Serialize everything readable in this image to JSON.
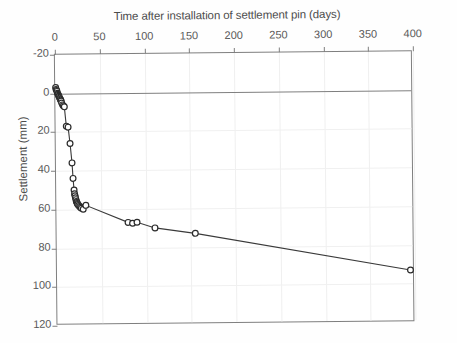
{
  "chart_data": {
    "type": "line",
    "title": "Time after installation of settlement pin (days)",
    "xlabel": "Time after installation of settlement pin (days)",
    "ylabel": "Settlement (mm)",
    "xlim": [
      0,
      400
    ],
    "ylim": [
      -20,
      120
    ],
    "y_inverted": true,
    "grid": true,
    "legend": "none",
    "xticks": [
      0,
      50,
      100,
      150,
      200,
      250,
      300,
      350,
      400
    ],
    "yticks": [
      -20,
      0,
      20,
      40,
      60,
      80,
      100,
      120
    ],
    "series": [
      {
        "name": "Settlement pin",
        "marker": "open-circle",
        "x": [
          0.5,
          1,
          1.5,
          2,
          2.5,
          3,
          3.5,
          4,
          4.5,
          5,
          5.5,
          6,
          6.5,
          7,
          8,
          9,
          10,
          12,
          14,
          16,
          18,
          19,
          20,
          20.5,
          21,
          21.5,
          22,
          22.5,
          23,
          23.5,
          24,
          25,
          26,
          27,
          28,
          30,
          33,
          80,
          85,
          90,
          110,
          155,
          395
        ],
        "y": [
          -3,
          -2,
          -1.5,
          -1,
          0,
          0.5,
          1,
          1.5,
          2,
          2.5,
          3,
          3.5,
          4,
          5,
          6,
          6.5,
          7,
          17,
          17.5,
          26,
          36,
          44,
          50,
          52,
          53,
          54,
          55,
          56,
          56.5,
          57,
          57.5,
          58,
          58.5,
          59,
          59.5,
          60,
          58,
          67,
          67.5,
          67,
          70,
          73,
          93
        ]
      }
    ]
  },
  "axes": {
    "x_tick_labels": [
      "0",
      "50",
      "100",
      "150",
      "200",
      "250",
      "300",
      "350",
      "400"
    ],
    "y_tick_labels": [
      "-20",
      "0",
      "20",
      "40",
      "60",
      "80",
      "100",
      "120"
    ]
  },
  "style": {
    "axis_color": "#7f7f7f",
    "grid_color": "#f0f0f0",
    "marker_stroke": "#2b2b2b",
    "line_color": "#3a3a3a",
    "text_color": "#4d4d4d",
    "background": "#ffffff"
  }
}
